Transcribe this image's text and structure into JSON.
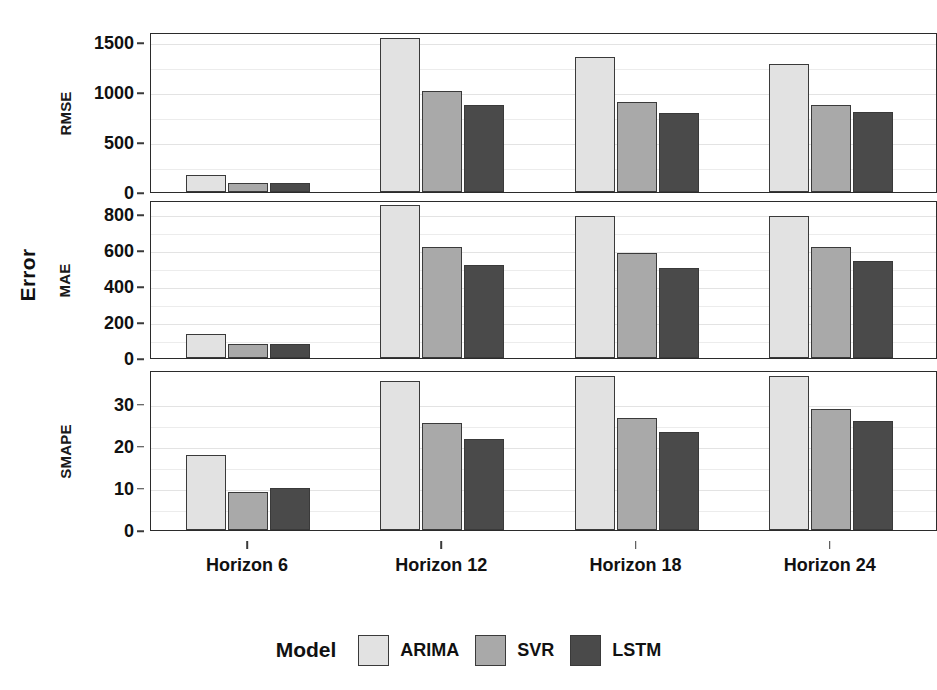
{
  "figure": {
    "y_axis_title": "Error"
  },
  "legend": {
    "title": "Model",
    "items": [
      {
        "label": "ARIMA",
        "color": "#e2e2e2"
      },
      {
        "label": "SVR",
        "color": "#a9a9a9"
      },
      {
        "label": "LSTM",
        "color": "#4a4a4a"
      }
    ]
  },
  "chart_data": {
    "type": "bar",
    "title": "",
    "xlabel": "",
    "ylabel": "Error",
    "grid": true,
    "legend_position": "bottom",
    "categories": [
      "Horizon 6",
      "Horizon 12",
      "Horizon 18",
      "Horizon 24"
    ],
    "series_names": [
      "ARIMA",
      "SVR",
      "LSTM"
    ],
    "series_colors": [
      "#e2e2e2",
      "#a9a9a9",
      "#4a4a4a"
    ],
    "panels": [
      {
        "name": "RMSE",
        "ylim": [
          0,
          1600
        ],
        "yticks": [
          0,
          500,
          1000,
          1500
        ],
        "ytick_labels": [
          "0",
          "500",
          "1000",
          "1500"
        ],
        "series": [
          {
            "name": "ARIMA",
            "values": [
              175,
              1540,
              1355,
              1280
            ]
          },
          {
            "name": "SVR",
            "values": [
              95,
              1010,
              900,
              875
            ]
          },
          {
            "name": "LSTM",
            "values": [
              90,
              870,
              790,
              800
            ]
          }
        ]
      },
      {
        "name": "MAE",
        "ylim": [
          0,
          880
        ],
        "yticks": [
          0,
          200,
          400,
          600,
          800
        ],
        "ytick_labels": [
          "0",
          "200",
          "400",
          "600",
          "800"
        ],
        "series": [
          {
            "name": "ARIMA",
            "values": [
              135,
              855,
              790,
              790
            ]
          },
          {
            "name": "SVR",
            "values": [
              80,
              620,
              585,
              620
            ]
          },
          {
            "name": "LSTM",
            "values": [
              78,
              520,
              500,
              540
            ]
          }
        ]
      },
      {
        "name": "SMAPE",
        "ylim": [
          0,
          38
        ],
        "yticks": [
          0,
          10,
          20,
          30
        ],
        "ytick_labels": [
          "0",
          "10",
          "20",
          "30"
        ],
        "series": [
          {
            "name": "ARIMA",
            "values": [
              17.8,
              35.5,
              36.5,
              36.5
            ]
          },
          {
            "name": "SVR",
            "values": [
              9.0,
              25.5,
              26.5,
              28.8
            ]
          },
          {
            "name": "LSTM",
            "values": [
              10.0,
              21.5,
              23.2,
              26.0
            ]
          }
        ]
      }
    ]
  }
}
